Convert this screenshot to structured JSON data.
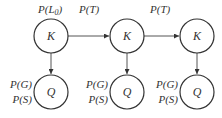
{
  "diagram": {
    "type": "dynamic-bayesian-network",
    "colors": {
      "stroke": "#333333",
      "edge": "#555555",
      "background": "#ffffff"
    },
    "top_labels": [
      {
        "text": "P(L",
        "sub": "0",
        "close": ")"
      },
      {
        "text": "P(T)"
      },
      {
        "text": "P(T)"
      }
    ],
    "knowledge_nodes": [
      {
        "label": "K"
      },
      {
        "label": "K"
      },
      {
        "label": "K"
      }
    ],
    "question_nodes": [
      {
        "label": "Q",
        "params": [
          "P(G)",
          "P(S)"
        ]
      },
      {
        "label": "Q",
        "params": [
          "P(G)",
          "P(S)"
        ]
      },
      {
        "label": "Q",
        "params": [
          "P(G)",
          "P(S)"
        ]
      }
    ],
    "edges": [
      {
        "from": "K1",
        "to": "K2"
      },
      {
        "from": "K2",
        "to": "K3"
      },
      {
        "from": "K1",
        "to": "Q1"
      },
      {
        "from": "K2",
        "to": "Q2"
      },
      {
        "from": "K3",
        "to": "Q3"
      }
    ]
  }
}
